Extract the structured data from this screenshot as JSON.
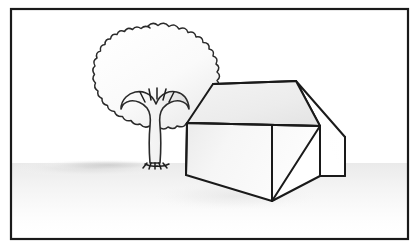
{
  "document": {
    "kind": "line-drawing-illustration",
    "title": "House and tree line drawing",
    "width": 418,
    "height": 249,
    "background_color": "#ffffff",
    "caption": "",
    "visible_text": []
  },
  "frame": {
    "name": "picture-border",
    "stroke_color": "#1a1a1a",
    "stroke_width": 2.2,
    "fill_color": "#ffffff",
    "x": 11,
    "y": 9,
    "width": 397,
    "height": 230
  },
  "ground": {
    "name": "ground-shadow",
    "shadow_color": "#d9d9d9",
    "shadow_color_soft": "#ebebeb",
    "horizon_y": 163,
    "description": "soft grey cast shadow spreading left from the tree base along the ground"
  },
  "tree": {
    "name": "tree",
    "canopy": {
      "fill_color": "#fbfbfb",
      "shade_color": "#ededed",
      "stroke_color": "#2a2a2a",
      "stroke_width": 1.5,
      "center_x": 148,
      "center_y": 74,
      "radius_x": 63,
      "radius_y": 48,
      "scallop_count": 34,
      "scallop_depth": 4,
      "style": "scalloped cloud-like outline"
    },
    "trunk": {
      "fill_color": "#f6f6f6",
      "shade_color": "#e2e2e2",
      "stroke_color": "#2a2a2a",
      "stroke_width": 1.6,
      "base_x": 156,
      "base_y": 163,
      "fork_y": 112,
      "branch_count": 2,
      "left_branch_tip_x": 124,
      "right_branch_tip_x": 184
    },
    "fork_rays": {
      "name": "branch-detail-rays",
      "count": 5,
      "stroke_color": "#1d1d1d",
      "origin_x": 157,
      "origin_y": 110,
      "length": 13
    },
    "roots": {
      "name": "root-tufts",
      "count": 5,
      "stroke_color": "#1d1d1d"
    }
  },
  "house": {
    "name": "house",
    "stroke_color": "#1a1a1a",
    "stroke_width": 2.0,
    "roof": {
      "name": "roof-plane",
      "fill_color": "#eeeeee",
      "fill_color_light": "#f7f7f7",
      "points": "187,123 213,84 296,81 320,126"
    },
    "front_wall": {
      "name": "front-wall",
      "fill_color": "#f2f2f2",
      "fill_color_light": "#fafafa",
      "points": "187,123 320,126 272,201 186,175"
    },
    "gable_end": {
      "name": "right-gable-end",
      "fill_color": "#ffffff",
      "points": "320,126 296,81 345,137 345,176 320,176"
    },
    "right_wall": {
      "name": "right-side-wall",
      "fill_color": "#fdfdfd",
      "points": "320,126 345,176 320,176 272,201"
    },
    "ridge_line": {
      "name": "roof-ridge-line",
      "from_x": 213,
      "from_y": 84,
      "to_x": 296,
      "to_y": 81
    },
    "eave_line": {
      "name": "roof-eave-line",
      "from_x": 187,
      "from_y": 123,
      "to_x": 320,
      "to_y": 126
    },
    "front_corner_edge": {
      "name": "front-corner-edge",
      "from_x": 272,
      "from_y": 126,
      "to_x": 272,
      "to_y": 201
    }
  },
  "palette": {
    "ink": "#1a1a1a",
    "paper": "#ffffff",
    "light_grey": "#f2f2f2",
    "mid_grey": "#dedede",
    "shadow_grey": "#d4d4d4"
  }
}
